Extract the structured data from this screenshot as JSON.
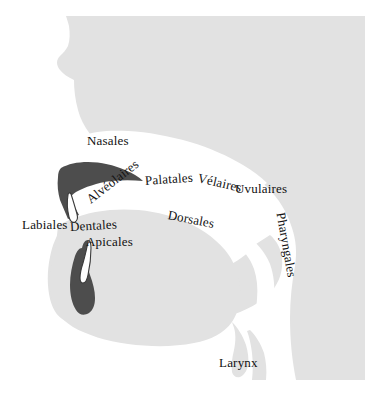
{
  "figure": {
    "width": 365,
    "height": 396
  },
  "colors": {
    "background": "#ffffff",
    "tissue": "#e2e2e2",
    "tissue_edge": "#d8d8d8",
    "cavity": "#ffffff",
    "articulator_dark": "#4d4d4d",
    "tooth": "#ffffff",
    "tooth_outline": "#3a3a3a",
    "label_text": "#111111"
  },
  "labels": [
    {
      "id": "nasales",
      "text": "Nasales",
      "x": 87,
      "y": 140,
      "rotation": 0,
      "font_size": 13,
      "region": "nasal-cavity"
    },
    {
      "id": "alveolaires",
      "text": "Alvéolaires",
      "x": 88,
      "y": 200,
      "rotation": -38,
      "font_size": 13,
      "region": "alveolar-ridge"
    },
    {
      "id": "palatales",
      "text": "Palatales",
      "x": 145,
      "y": 180,
      "rotation": -4,
      "font_size": 13,
      "region": "hard-palate"
    },
    {
      "id": "velaires",
      "text": "Vélaires",
      "x": 198,
      "y": 177,
      "rotation": 13,
      "font_size": 13,
      "region": "soft-palate"
    },
    {
      "id": "uvulaires",
      "text": "Uvulaires",
      "x": 235,
      "y": 188,
      "rotation": 0,
      "font_size": 13,
      "region": "uvula"
    },
    {
      "id": "labiales",
      "text": "Labiales",
      "x": 22,
      "y": 224,
      "rotation": 0,
      "font_size": 13,
      "region": "lips"
    },
    {
      "id": "dentales",
      "text": "Dentales",
      "x": 70,
      "y": 226,
      "rotation": -3,
      "font_size": 13,
      "region": "teeth"
    },
    {
      "id": "apicales",
      "text": "Apicales",
      "x": 86,
      "y": 241,
      "rotation": 0,
      "font_size": 13,
      "region": "tongue-tip"
    },
    {
      "id": "dorsales",
      "text": "Dorsales",
      "x": 168,
      "y": 214,
      "rotation": 11,
      "font_size": 13,
      "region": "tongue-dorsum"
    },
    {
      "id": "pharyngales",
      "text": "Pharyngales",
      "x": 281,
      "y": 212,
      "rotation": 80,
      "font_size": 13,
      "region": "pharynx"
    },
    {
      "id": "larynx",
      "text": "Larynx",
      "x": 219,
      "y": 362,
      "rotation": 0,
      "font_size": 13,
      "region": "larynx"
    }
  ],
  "anatomy": [
    {
      "id": "head-tissue",
      "name": "head-and-neck-tissue",
      "fill": "tissue"
    },
    {
      "id": "nasal-cavity",
      "name": "nasal-cavity",
      "fill": "cavity"
    },
    {
      "id": "oral-cavity",
      "name": "oral-cavity",
      "fill": "cavity"
    },
    {
      "id": "pharyngeal-cavity",
      "name": "pharyngeal-cavity",
      "fill": "cavity"
    },
    {
      "id": "palate",
      "name": "hard-palate-and-upper-jaw",
      "fill": "articulator_dark"
    },
    {
      "id": "tongue",
      "name": "tongue",
      "fill": "articulator_dark"
    },
    {
      "id": "upper-tooth",
      "name": "upper-incisor",
      "fill": "tooth"
    },
    {
      "id": "lower-tooth",
      "name": "lower-incisor",
      "fill": "tooth"
    },
    {
      "id": "epiglottis",
      "name": "epiglottis",
      "fill": "tissue"
    },
    {
      "id": "larynx-body",
      "name": "larynx",
      "fill": "tissue"
    }
  ]
}
